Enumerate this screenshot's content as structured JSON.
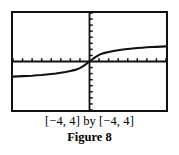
{
  "figure": {
    "caption_window": "[−4, 4] by [−4, 4]",
    "label": "Figure 8",
    "ink_color": "#111111",
    "background_color": "#ffffff"
  },
  "chart_data": {
    "type": "line",
    "title": "",
    "subtitle": "",
    "xlabel": "",
    "ylabel": "",
    "xlim": [
      -4,
      4
    ],
    "ylim": [
      -4,
      4
    ],
    "grid": false,
    "legend": null,
    "axis_style": "calculator-screen-with-tick-marks",
    "x_tick_step": 0.5,
    "y_tick_step": 0.5,
    "x_ticks": [
      -4,
      -3.5,
      -3,
      -2.5,
      -2,
      -1.5,
      -1,
      -0.5,
      0,
      0.5,
      1,
      1.5,
      2,
      2.5,
      3,
      3.5,
      4
    ],
    "y_ticks": [
      -4,
      -3.5,
      -3,
      -2.5,
      -2,
      -1.5,
      -1,
      -0.5,
      0,
      0.5,
      1,
      1.5,
      2,
      2.5,
      3,
      3.5,
      4
    ],
    "series": [
      {
        "name": "curve",
        "description": "increasing odd sigmoid-shaped curve through the origin, flattening toward horizontal asymptotes near y = ±1.25",
        "x": [
          -4.0,
          -3.75,
          -3.5,
          -3.25,
          -3.0,
          -2.75,
          -2.5,
          -2.25,
          -2.0,
          -1.75,
          -1.5,
          -1.25,
          -1.0,
          -0.75,
          -0.5,
          -0.25,
          0.0,
          0.25,
          0.5,
          0.75,
          1.0,
          1.25,
          1.5,
          1.75,
          2.0,
          2.25,
          2.5,
          2.75,
          3.0,
          3.25,
          3.5,
          3.75,
          4.0
        ],
        "y": [
          -1.25,
          -1.23,
          -1.21,
          -1.19,
          -1.17,
          -1.14,
          -1.11,
          -1.07,
          -1.03,
          -0.99,
          -0.93,
          -0.87,
          -0.79,
          -0.69,
          -0.55,
          -0.3,
          0.0,
          0.3,
          0.55,
          0.69,
          0.79,
          0.87,
          0.93,
          0.99,
          1.03,
          1.07,
          1.11,
          1.14,
          1.17,
          1.19,
          1.21,
          1.23,
          1.25
        ]
      }
    ]
  }
}
